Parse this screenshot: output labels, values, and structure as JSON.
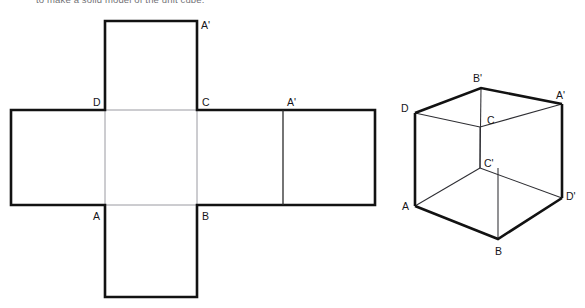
{
  "caption": {
    "text": "to make a solid model of the unit cube."
  },
  "figure": {
    "kind": "geometry-diagram",
    "ink_color": "#121212",
    "fold_line_color": "#8e8e96",
    "background_color": "#ffffff"
  },
  "net": {
    "name": "cube-net",
    "shape": "cross",
    "squares": 6,
    "band": {
      "x": 11,
      "y": 110,
      "width": 364,
      "height": 95
    },
    "flap_column": {
      "x": 105,
      "width": 92
    },
    "top_flap": {
      "y": 21,
      "height": 89
    },
    "bottom_flap": {
      "y": 207,
      "height": 90
    },
    "fold_x": [
      105,
      197,
      283
    ],
    "labels": [
      {
        "id": "net-label-a-prime-top",
        "text": "A'",
        "x": 201,
        "y": 29
      },
      {
        "id": "net-label-d",
        "text": "D",
        "x": 93,
        "y": 106
      },
      {
        "id": "net-label-c",
        "text": "C",
        "x": 202,
        "y": 106
      },
      {
        "id": "net-label-a-prime-mid",
        "text": "A'",
        "x": 287,
        "y": 106
      },
      {
        "id": "net-label-a",
        "text": "A",
        "x": 93,
        "y": 220
      },
      {
        "id": "net-label-b",
        "text": "B",
        "x": 202,
        "y": 220
      }
    ]
  },
  "cube": {
    "name": "cube-wireframe",
    "vertices": {
      "A": {
        "x": 415,
        "y": 206
      },
      "B": {
        "x": 498,
        "y": 239
      },
      "D_prime": {
        "x": 562,
        "y": 198
      },
      "C_prime": {
        "x": 480,
        "y": 168
      },
      "D": {
        "x": 415,
        "y": 113
      },
      "B_prime": {
        "x": 481,
        "y": 88
      },
      "A_prime": {
        "x": 562,
        "y": 104
      },
      "C": {
        "x": 480,
        "y": 127
      }
    },
    "labels": [
      {
        "id": "cube-label-b-prime",
        "text": "B'",
        "x": 473,
        "y": 82
      },
      {
        "id": "cube-label-a-prime",
        "text": "A'",
        "x": 556,
        "y": 99
      },
      {
        "id": "cube-label-d",
        "text": "D",
        "x": 401,
        "y": 112
      },
      {
        "id": "cube-label-c",
        "text": "C",
        "x": 487,
        "y": 124
      },
      {
        "id": "cube-label-c-prime",
        "text": "C'",
        "x": 484,
        "y": 167
      },
      {
        "id": "cube-label-d-prime",
        "text": "D'",
        "x": 566,
        "y": 200
      },
      {
        "id": "cube-label-a",
        "text": "A",
        "x": 402,
        "y": 210
      },
      {
        "id": "cube-label-b",
        "text": "B",
        "x": 495,
        "y": 255
      }
    ]
  }
}
